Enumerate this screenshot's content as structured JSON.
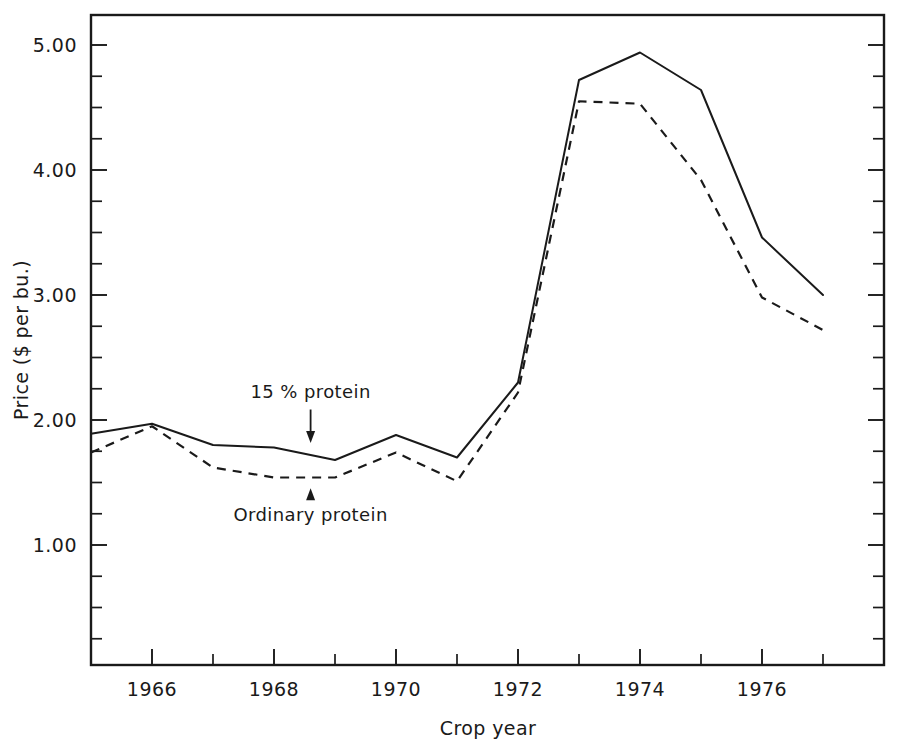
{
  "chart_data": {
    "type": "line",
    "title": "",
    "xlabel": "Crop year",
    "ylabel": "Price ($ per bu.)",
    "x": [
      1965,
      1966,
      1967,
      1968,
      1969,
      1970,
      1971,
      1972,
      1973,
      1974,
      1975,
      1976,
      1977
    ],
    "xlim": [
      1965,
      1978
    ],
    "ylim": [
      0.0,
      5.4
    ],
    "grid": false,
    "legend_position": "inline-annotations",
    "x_tick_labels": [
      "1966",
      "1968",
      "1970",
      "1972",
      "1974",
      "1976"
    ],
    "x_major_ticks": [
      1966,
      1968,
      1970,
      1972,
      1974,
      1976
    ],
    "x_minor_ticks": [
      1967,
      1969,
      1971,
      1973,
      1975,
      1977
    ],
    "y_tick_labels": [
      "5.00",
      "4.00",
      "3.00",
      "2.00",
      "1.00"
    ],
    "y_major_ticks": [
      5.0,
      4.0,
      3.0,
      2.0,
      1.0
    ],
    "y_minor_ticks": [
      4.75,
      4.5,
      4.25,
      3.75,
      3.5,
      3.25,
      2.75,
      2.5,
      2.25,
      1.75,
      1.5,
      1.25,
      0.75,
      0.5,
      0.25
    ],
    "series": [
      {
        "name": "15 % protein",
        "style": "solid",
        "values": [
          1.89,
          1.97,
          1.8,
          1.78,
          1.68,
          1.88,
          1.7,
          2.3,
          4.72,
          4.94,
          4.64,
          3.46,
          3.0
        ]
      },
      {
        "name": "Ordinary protein",
        "style": "dashed",
        "values": [
          1.74,
          1.95,
          1.62,
          1.54,
          1.54,
          1.74,
          1.51,
          2.22,
          4.55,
          4.53,
          3.92,
          2.98,
          2.72
        ]
      }
    ],
    "annotations": [
      {
        "text": "15 % protein",
        "target_series": "15 % protein",
        "arrow_direction": "down",
        "x": 1968.6,
        "label_y": 2.18,
        "tip_y": 1.8
      },
      {
        "text": "Ordinary protein",
        "target_series": "Ordinary protein",
        "arrow_direction": "up",
        "x": 1968.6,
        "label_y": 1.19,
        "tip_y": 1.47
      }
    ]
  },
  "colors": {
    "ink": "#1a1a1a",
    "background": "#ffffff"
  }
}
